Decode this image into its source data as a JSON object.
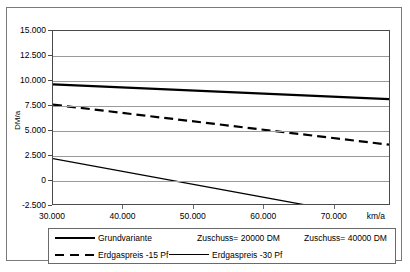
{
  "chart_data": {
    "type": "line",
    "title": "",
    "xlabel": "km/a",
    "ylabel": "DM/a",
    "xlim": [
      30000,
      78000
    ],
    "ylim": [
      -2500,
      15000
    ],
    "grid": true,
    "legend_position": "bottom",
    "x_ticks": [
      30000,
      40000,
      50000,
      60000,
      70000
    ],
    "x_tick_labels": [
      "30.000",
      "40.000",
      "50.000",
      "60.000",
      "70.000"
    ],
    "y_ticks": [
      15000,
      12500,
      10000,
      7500,
      5000,
      2500,
      0,
      -2500
    ],
    "y_tick_labels": [
      "15.000",
      "12.500",
      "10.000",
      "7.500",
      "5.000",
      "2.500",
      "0",
      "-2.500"
    ],
    "x": [
      30000,
      78000
    ],
    "series": [
      {
        "name": "Grundvariante",
        "style": "solid-thick",
        "values": [
          9600,
          8100
        ]
      },
      {
        "name": "Erdgaspreis -15 Pf",
        "style": "dashed",
        "values": [
          7550,
          3500
        ]
      },
      {
        "name": "Erdgaspreis -30 Pf",
        "style": "solid-thin",
        "values": [
          2100,
          -4150
        ]
      }
    ],
    "annotations": [
      "Zuschuss= 20000 DM",
      "Zuschuss= 40000 DM"
    ]
  },
  "legend": {
    "row1": [
      {
        "label": "Grundvariante",
        "swatch": "solid-thick"
      },
      {
        "label": "Zuschuss= 20000 DM",
        "swatch": "none"
      },
      {
        "label": "Zuschuss= 40000 DM",
        "swatch": "none"
      }
    ],
    "row2": [
      {
        "label": "Erdgaspreis -15 Pf",
        "swatch": "dashed"
      },
      {
        "label": "Erdgaspreis -30 Pf",
        "swatch": "solid-thin"
      }
    ]
  },
  "axis": {
    "y_title": "DM/a",
    "x_unit": "km/a"
  }
}
